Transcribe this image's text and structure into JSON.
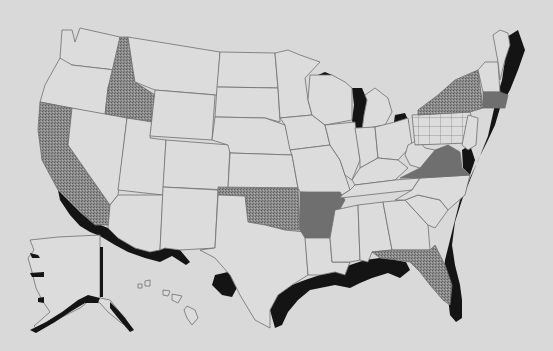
{
  "map": {
    "title": "",
    "background": "#d9d9d9",
    "fills": {
      "plain": "#dcdcdc",
      "stipple": "#8a8a8a",
      "solid_gray": "#6f6f6f",
      "grid": "#dcdcdc",
      "coastal_black": "#141414"
    },
    "highlighted_states": {
      "stipple": [
        "Idaho",
        "California",
        "Oklahoma",
        "New York",
        "Florida"
      ],
      "solid_gray": [
        "Arkansas",
        "Virginia",
        "Connecticut/Massachusetts region"
      ],
      "grid": [
        "Pennsylvania"
      ]
    },
    "coastal_bands": [
      "Atlantic coast",
      "Gulf coast",
      "Southern California/Mexico border",
      "Great Lakes",
      "Alaska coast"
    ],
    "insets": [
      "Alaska",
      "Hawaii"
    ]
  }
}
